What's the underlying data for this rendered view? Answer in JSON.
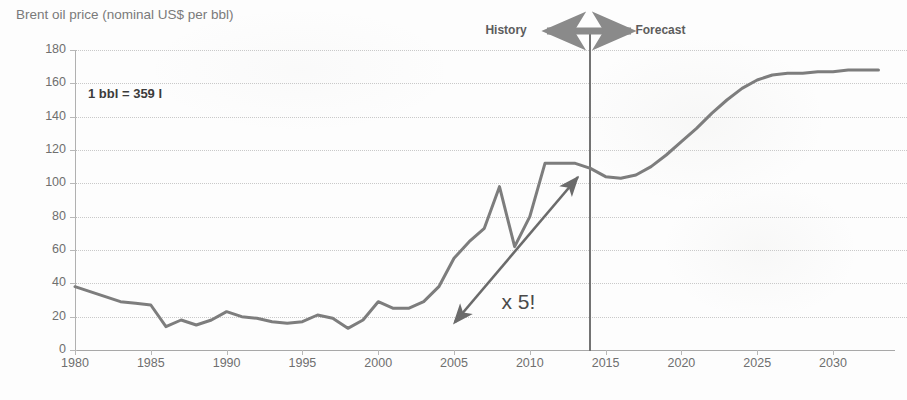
{
  "chart_data": {
    "type": "line",
    "title": "Brent oil price (nominal US$ per bbl)",
    "xlabel": "",
    "ylabel": "",
    "xlim": [
      1980,
      2033
    ],
    "ylim": [
      0,
      180
    ],
    "ytick_step": 20,
    "xtick_step": 5,
    "grid": true,
    "legend": false,
    "yticks": [
      "180",
      "160",
      "140",
      "120",
      "100",
      "80",
      "60",
      "40",
      "20",
      "0"
    ],
    "xticks": [
      "1980",
      "1985",
      "1990",
      "1995",
      "2000",
      "2005",
      "2010",
      "2015",
      "2020",
      "2025",
      "2030"
    ],
    "series": [
      {
        "name": "Brent oil price",
        "color": "#7d7d7d",
        "x": [
          1980,
          1981,
          1982,
          1983,
          1984,
          1985,
          1986,
          1987,
          1988,
          1989,
          1990,
          1991,
          1992,
          1993,
          1994,
          1995,
          1996,
          1997,
          1998,
          1999,
          2000,
          2001,
          2002,
          2003,
          2004,
          2005,
          2006,
          2007,
          2008,
          2009,
          2010,
          2011,
          2012,
          2013,
          2014,
          2015,
          2016,
          2017,
          2018,
          2019,
          2020,
          2021,
          2022,
          2023,
          2024,
          2025,
          2026,
          2027,
          2028,
          2029,
          2030,
          2031,
          2032,
          2033
        ],
        "y": [
          38,
          35,
          32,
          29,
          28,
          27,
          14,
          18,
          15,
          18,
          23,
          20,
          19,
          17,
          16,
          17,
          21,
          19,
          13,
          18,
          29,
          25,
          25,
          29,
          38,
          55,
          65,
          73,
          98,
          62,
          80,
          112,
          112,
          112,
          109,
          104,
          103,
          105,
          110,
          117,
          125,
          133,
          142,
          150,
          157,
          162,
          165,
          166,
          166,
          167,
          167,
          168,
          168,
          168
        ]
      }
    ],
    "annotations": [
      {
        "name": "bbl-note",
        "text": "1 bbl = 359 l"
      },
      {
        "name": "history-label",
        "text": "History"
      },
      {
        "name": "forecast-label",
        "text": "Forecast"
      },
      {
        "name": "multiplier-callout",
        "text": "x 5!"
      },
      {
        "name": "divider-year",
        "value": "2014"
      }
    ]
  },
  "colors": {
    "line": "#7d7d7d",
    "grid": "#c9c9c9",
    "axis": "#a8a8a8",
    "title_text": "#7a7a7a",
    "tick_text": "#6f6f6f",
    "annotation_text": "#3b3b3b",
    "divider": "#737373",
    "arrow": "#6b6b6b",
    "background": "#fdfdfd"
  }
}
